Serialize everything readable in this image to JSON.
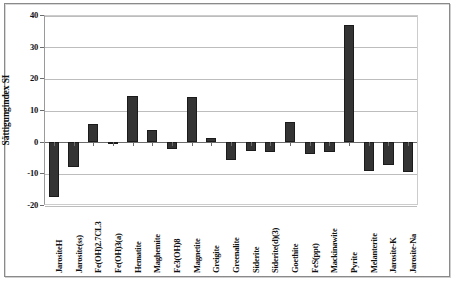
{
  "chart_data": {
    "type": "bar",
    "title": "",
    "xlabel": "",
    "ylabel": "Sättigungindex SI",
    "ylim": [
      -20,
      40
    ],
    "yticks": [
      40,
      30,
      20,
      10,
      0,
      -10,
      -20
    ],
    "ytick_labels": [
      "40",
      "30",
      "20",
      "10",
      "0",
      "-10",
      "-20"
    ],
    "grid": true,
    "legend": "none",
    "bar_color": "#343434",
    "categories": [
      "JarositeH",
      "Jarosite(ss)",
      "Fe(OH)2.7CL3",
      "Fe(OH)3(a)",
      "Hematite",
      "Maghemite",
      "Fe3(OH)8",
      "Magnetite",
      "Greigite",
      "Greenalite",
      "Siderite",
      "Siderite(d)(3)",
      "Goethite",
      "FeS(ppt)",
      "Mackinawite",
      "Pyrite",
      "Melanterite",
      "Jarosite-K",
      "Jarosite-Na"
    ],
    "values": [
      -17.4,
      -8.0,
      5.6,
      -0.3,
      14.3,
      3.8,
      -2.2,
      14.2,
      1.1,
      -5.8,
      -2.8,
      -3.3,
      6.2,
      -3.8,
      -3.2,
      36.8,
      -9.2,
      -7.5,
      -9.5
    ]
  }
}
